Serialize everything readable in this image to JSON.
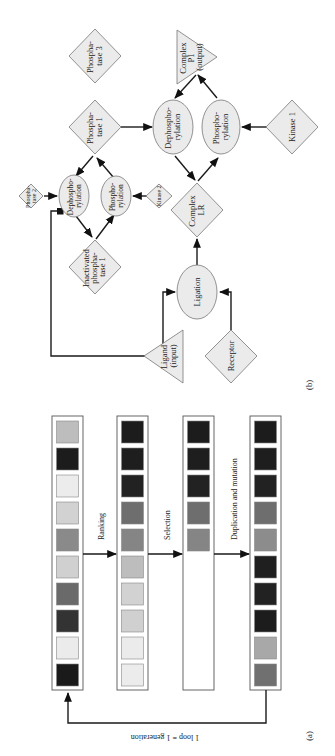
{
  "figure": {
    "orientation": "rotated-90-clockwise",
    "panel_a": {
      "label": "(a)",
      "loop_caption": "1 loop = 1 generation",
      "steps": [
        "Ranking",
        "Selection",
        "Duplication and mutation"
      ],
      "columns": [
        {
          "name": "initial-population",
          "cells": [
            "#bdbdbd",
            "#1c1c1c",
            "#ececec",
            "#d2d2d2",
            "#8a8a8a",
            "#d0d0d0",
            "#6a6a6a",
            "#333333",
            "#ebebeb",
            "#1a1a1a"
          ]
        },
        {
          "name": "ranked-population",
          "cells": [
            "#1c1c1c",
            "#1e1e1e",
            "#222222",
            "#6e6e6e",
            "#858585",
            "#bdbdbd",
            "#d2d2d2",
            "#d0d0d0",
            "#ebebeb",
            "#ececec"
          ]
        },
        {
          "name": "selected-population",
          "cells": [
            "#1c1c1c",
            "#1e1e1e",
            "#222222",
            "#6e6e6e",
            "#858585",
            null,
            null,
            null,
            null,
            null
          ]
        },
        {
          "name": "new-population",
          "cells": [
            "#1c1c1c",
            "#1e1e1e",
            "#222222",
            "#6e6e6e",
            "#8c8c8c",
            "#1f1f1f",
            "#222222",
            "#1c1c1c",
            "#a8a8a8",
            "#707070"
          ]
        }
      ]
    },
    "panel_b": {
      "label": "(b)",
      "nodes": {
        "phosphatase3": [
          "Phospha-",
          "tase 3"
        ],
        "complex_p1": [
          "Complex",
          "P1",
          "(output)"
        ],
        "phosphatase1": [
          "Phospha-",
          "tase 1"
        ],
        "dephos_main": [
          "Dephospho-",
          "rylation"
        ],
        "phos_main": [
          "Phospho-",
          "rylation"
        ],
        "kinase1": [
          "Kinase 1"
        ],
        "phosphatase2": [
          "Phospha-",
          "tase 2"
        ],
        "dephos_small": [
          "Dephospho-",
          "rylation"
        ],
        "phos_small": [
          "Phospho-",
          "rylation"
        ],
        "kinase2": [
          "Kinase 2"
        ],
        "complex_lr": [
          "Complex",
          "LR"
        ],
        "inactivated_phosphatase1": [
          "Inactivated",
          "phospha-",
          "tase 1"
        ],
        "ligation": [
          "Ligation"
        ],
        "ligand": [
          "Ligand",
          "(input)"
        ],
        "receptor": [
          "Receptor"
        ]
      }
    }
  }
}
